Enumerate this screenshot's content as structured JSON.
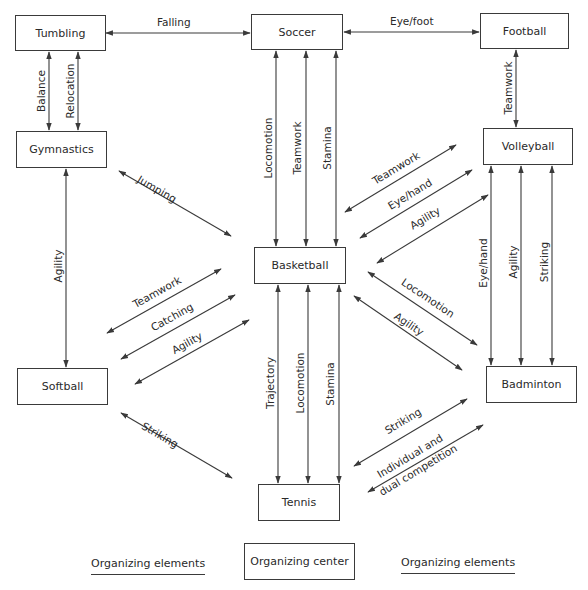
{
  "diagram": {
    "type": "concept-map",
    "organizing_center": "Basketball",
    "nodes": {
      "tumbling": "Tumbling",
      "soccer": "Soccer",
      "football": "Football",
      "gymnastics": "Gymnastics",
      "volleyball": "Volleyball",
      "basketball": "Basketball",
      "softball": "Softball",
      "badminton": "Badminton",
      "tennis": "Tennis"
    },
    "edges": {
      "tumbling_soccer": "Falling",
      "soccer_football": "Eye/foot",
      "tumbling_gymnastics_1": "Balance",
      "tumbling_gymnastics_2": "Relocation",
      "football_volleyball": "Teamwork",
      "soccer_basketball_1": "Locomotion",
      "soccer_basketball_2": "Teamwork",
      "soccer_basketball_3": "Stamina",
      "gymnastics_softball": "Agility",
      "gymnastics_basketball": "Jumping",
      "softball_basketball_1": "Teamwork",
      "softball_basketball_2": "Catching",
      "softball_basketball_3": "Agility",
      "volleyball_basketball_1": "Teamwork",
      "volleyball_basketball_2": "Eye/hand",
      "volleyball_basketball_3": "Agility",
      "volleyball_badminton_1": "Eye/hand",
      "volleyball_badminton_2": "Agility",
      "volleyball_badminton_3": "Striking",
      "basketball_badminton_1": "Locomotion",
      "basketball_badminton_2": "Agility",
      "basketball_tennis_1": "Trajectory",
      "basketball_tennis_2": "Locomotion",
      "basketball_tennis_3": "Stamina",
      "softball_tennis": "Striking",
      "tennis_badminton_1": "Striking",
      "tennis_badminton_2a": "Individual and",
      "tennis_badminton_2b": "dual competition"
    },
    "legend": {
      "left": "Organizing elements",
      "center": "Organizing center",
      "right": "Organizing elements"
    },
    "colors": {
      "line": "#3a3a3a",
      "text": "#2a2a2a",
      "background": "#ffffff"
    }
  }
}
